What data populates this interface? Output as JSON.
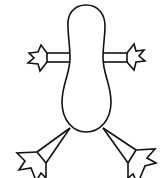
{
  "figure": {
    "stroke_color": "#111111",
    "background_color": "#ffffff",
    "parts": [
      "body",
      "left-arm",
      "right-arm",
      "left-leg",
      "right-leg"
    ]
  }
}
